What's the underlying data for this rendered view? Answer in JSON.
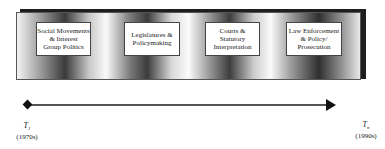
{
  "diagram": {
    "stages": [
      {
        "label": "Social Movements\n& Interest\nGroup Politics"
      },
      {
        "label": "Legislatures &\nPolicymaking"
      },
      {
        "label": "Courts &\nStatutory\nInterpretation"
      },
      {
        "label": "Law Enforcement\n& Policy/\nProsecution"
      }
    ],
    "timeline": {
      "start": {
        "symbol": "T",
        "subscript": "1",
        "period": "(1970s)"
      },
      "end": {
        "symbol": "T",
        "subscript": "n",
        "period": "(1990s)"
      }
    }
  }
}
